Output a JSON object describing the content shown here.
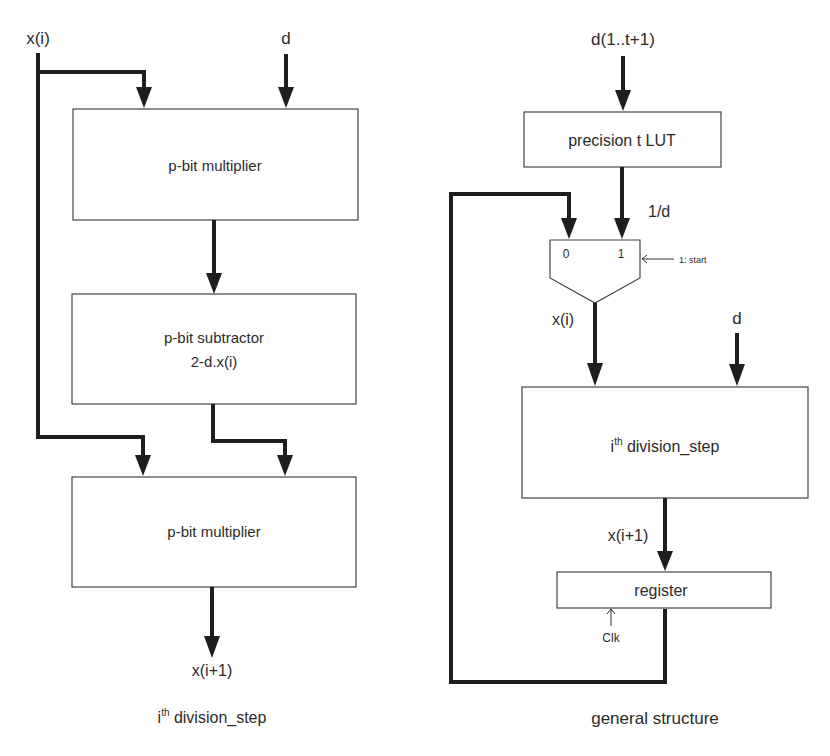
{
  "left_diagram": {
    "caption_base": "i",
    "caption_sup": "th",
    "caption_rest": " division_step",
    "input_x": "x(i)",
    "input_d": "d",
    "block1": "p-bit multiplier",
    "block2_line1": "p-bit subtractor",
    "block2_line2": "2-d.x(i)",
    "block3": "p-bit multiplier",
    "output": "x(i+1)"
  },
  "right_diagram": {
    "caption": "general structure",
    "input": "d(1..t+1)",
    "lut": "precision t  LUT",
    "lut_out": "1/d",
    "mux_in0": "0",
    "mux_in1": "1",
    "mux_select": "1: start",
    "mux_out": "x(i)",
    "input_d": "d",
    "step_base": "i",
    "step_sup": "th",
    "step_rest": " division_step",
    "step_out": "x(i+1)",
    "register": "register",
    "clock": "Clk"
  }
}
